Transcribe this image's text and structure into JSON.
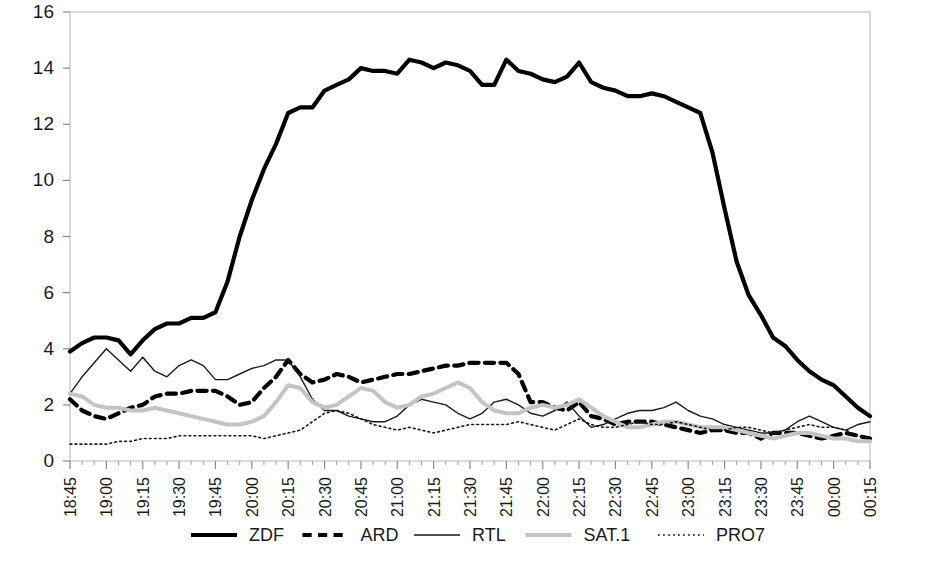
{
  "chart_data": {
    "type": "line",
    "title": "",
    "xlabel": "",
    "ylabel": "",
    "ylim": [
      0,
      16
    ],
    "ytick_labels": [
      "0",
      "2",
      "4",
      "6",
      "8",
      "10",
      "12",
      "14",
      "16"
    ],
    "ytick_values": [
      0,
      2,
      4,
      6,
      8,
      10,
      12,
      14,
      16
    ],
    "grid": false,
    "legend_position": "bottom",
    "minor_ticks_per_interval": 3,
    "x": [
      "18:45",
      "18:50",
      "18:55",
      "19:00",
      "19:05",
      "19:10",
      "19:15",
      "19:20",
      "19:25",
      "19:30",
      "19:35",
      "19:40",
      "19:45",
      "19:50",
      "19:55",
      "20:00",
      "20:05",
      "20:10",
      "20:15",
      "20:20",
      "20:25",
      "20:30",
      "20:35",
      "20:40",
      "20:45",
      "20:50",
      "20:55",
      "21:00",
      "21:05",
      "21:10",
      "21:15",
      "21:20",
      "21:25",
      "21:30",
      "21:35",
      "21:40",
      "21:45",
      "21:50",
      "21:55",
      "22:00",
      "22:05",
      "22:10",
      "22:15",
      "22:20",
      "22:25",
      "22:30",
      "22:35",
      "22:40",
      "22:45",
      "22:50",
      "22:55",
      "23:00",
      "23:05",
      "23:10",
      "23:15",
      "23:20",
      "23:25",
      "23:30",
      "23:35",
      "23:40",
      "23:45",
      "23:50",
      "23:55",
      "00:00",
      "00:05",
      "00:10",
      "00:15"
    ],
    "xtick_labels": [
      "18:45",
      "19:00",
      "19:15",
      "19:30",
      "19:45",
      "20:00",
      "20:15",
      "20:30",
      "20:45",
      "21:00",
      "21:15",
      "21:30",
      "21:45",
      "22:00",
      "22:15",
      "22:30",
      "22:45",
      "23:00",
      "23:15",
      "23:30",
      "23:45",
      "00:00",
      "00:15"
    ],
    "series": [
      {
        "name": "ZDF",
        "style": "solid",
        "color": "#000000",
        "width": 4.2,
        "values": [
          3.9,
          4.2,
          4.4,
          4.4,
          4.3,
          3.8,
          4.3,
          4.7,
          4.9,
          4.9,
          5.1,
          5.1,
          5.3,
          6.4,
          8.0,
          9.3,
          10.4,
          11.3,
          12.4,
          12.6,
          12.6,
          13.2,
          13.4,
          13.6,
          14.0,
          13.9,
          13.9,
          13.8,
          14.3,
          14.2,
          14.0,
          14.2,
          14.1,
          13.9,
          13.4,
          13.4,
          14.3,
          13.9,
          13.8,
          13.6,
          13.5,
          13.7,
          14.2,
          13.5,
          13.3,
          13.2,
          13.0,
          13.0,
          13.1,
          13.0,
          12.8,
          12.6,
          12.4,
          11.0,
          9.0,
          7.1,
          5.9,
          5.2,
          4.4,
          4.1,
          3.6,
          3.2,
          2.9,
          2.7,
          2.3,
          1.9,
          1.6
        ]
      },
      {
        "name": "ARD",
        "style": "dashed",
        "color": "#000000",
        "width": 4.2,
        "values": [
          2.2,
          1.8,
          1.6,
          1.5,
          1.7,
          1.9,
          2.0,
          2.3,
          2.4,
          2.4,
          2.5,
          2.5,
          2.5,
          2.3,
          2.0,
          2.1,
          2.6,
          3.0,
          3.6,
          3.1,
          2.8,
          2.9,
          3.1,
          3.0,
          2.8,
          2.9,
          3.0,
          3.1,
          3.1,
          3.2,
          3.3,
          3.4,
          3.4,
          3.5,
          3.5,
          3.5,
          3.5,
          3.1,
          2.1,
          2.1,
          1.9,
          1.8,
          2.1,
          1.6,
          1.5,
          1.3,
          1.4,
          1.4,
          1.4,
          1.3,
          1.2,
          1.1,
          1.0,
          1.1,
          1.1,
          1.0,
          1.0,
          0.8,
          1.0,
          1.0,
          1.0,
          0.9,
          0.8,
          0.9,
          1.0,
          0.9,
          0.8
        ]
      },
      {
        "name": "RTL",
        "style": "solid",
        "color": "#1a1a1a",
        "width": 1.4,
        "values": [
          2.4,
          3.0,
          3.5,
          4.0,
          3.6,
          3.2,
          3.7,
          3.2,
          3.0,
          3.4,
          3.6,
          3.4,
          2.9,
          2.9,
          3.1,
          3.3,
          3.4,
          3.6,
          3.6,
          3.0,
          2.2,
          1.8,
          1.8,
          1.6,
          1.5,
          1.4,
          1.4,
          1.6,
          2.0,
          2.2,
          2.1,
          2.0,
          1.7,
          1.5,
          1.7,
          2.1,
          2.2,
          2.0,
          1.7,
          1.6,
          1.8,
          2.1,
          1.6,
          1.2,
          1.3,
          1.5,
          1.7,
          1.8,
          1.8,
          1.9,
          2.1,
          1.8,
          1.6,
          1.5,
          1.3,
          1.2,
          1.1,
          1.0,
          1.0,
          1.1,
          1.4,
          1.6,
          1.4,
          1.2,
          1.1,
          1.3,
          1.4
        ]
      },
      {
        "name": "SAT.1",
        "style": "solid",
        "color": "#c4c4c4",
        "width": 4.0,
        "values": [
          2.4,
          2.3,
          2.0,
          1.9,
          1.9,
          1.8,
          1.8,
          1.9,
          1.8,
          1.7,
          1.6,
          1.5,
          1.4,
          1.3,
          1.3,
          1.4,
          1.6,
          2.1,
          2.7,
          2.6,
          2.1,
          1.9,
          2.0,
          2.3,
          2.6,
          2.5,
          2.1,
          1.9,
          2.0,
          2.3,
          2.4,
          2.6,
          2.8,
          2.6,
          2.1,
          1.8,
          1.7,
          1.7,
          1.9,
          2.0,
          1.9,
          2.0,
          2.2,
          1.9,
          1.6,
          1.4,
          1.2,
          1.2,
          1.3,
          1.4,
          1.4,
          1.3,
          1.2,
          1.2,
          1.2,
          1.1,
          1.0,
          0.9,
          0.8,
          0.9,
          1.0,
          1.0,
          0.9,
          0.8,
          0.8,
          0.7,
          0.7
        ]
      },
      {
        "name": "PRO7",
        "style": "dotted",
        "color": "#1a1a1a",
        "width": 1.6,
        "values": [
          0.6,
          0.6,
          0.6,
          0.6,
          0.7,
          0.7,
          0.8,
          0.8,
          0.8,
          0.9,
          0.9,
          0.9,
          0.9,
          0.9,
          0.9,
          0.9,
          0.8,
          0.9,
          1.0,
          1.1,
          1.4,
          1.7,
          1.8,
          1.7,
          1.5,
          1.3,
          1.2,
          1.1,
          1.2,
          1.1,
          1.0,
          1.1,
          1.2,
          1.3,
          1.3,
          1.3,
          1.3,
          1.4,
          1.3,
          1.2,
          1.1,
          1.3,
          1.5,
          1.3,
          1.2,
          1.2,
          1.3,
          1.4,
          1.3,
          1.3,
          1.4,
          1.3,
          1.2,
          1.1,
          1.1,
          1.2,
          1.2,
          1.1,
          1.0,
          1.1,
          1.2,
          1.3,
          1.2,
          1.2,
          1.1,
          0.9,
          0.8
        ]
      }
    ]
  },
  "legend": {
    "items": [
      {
        "label": "ZDF",
        "style": "solid",
        "color": "#000000",
        "width": 4.2
      },
      {
        "label": "ARD",
        "style": "dashed",
        "color": "#000000",
        "width": 4.2
      },
      {
        "label": "RTL",
        "style": "solid",
        "color": "#1a1a1a",
        "width": 1.4
      },
      {
        "label": "SAT.1",
        "style": "solid",
        "color": "#c4c4c4",
        "width": 4.0
      },
      {
        "label": "PRO7",
        "style": "dotted",
        "color": "#1a1a1a",
        "width": 1.6
      }
    ]
  },
  "colors": {
    "background": "#ffffff",
    "frame": "#c9c9c9",
    "text": "#1a1a1a",
    "gray_series": "#c4c4c4"
  }
}
